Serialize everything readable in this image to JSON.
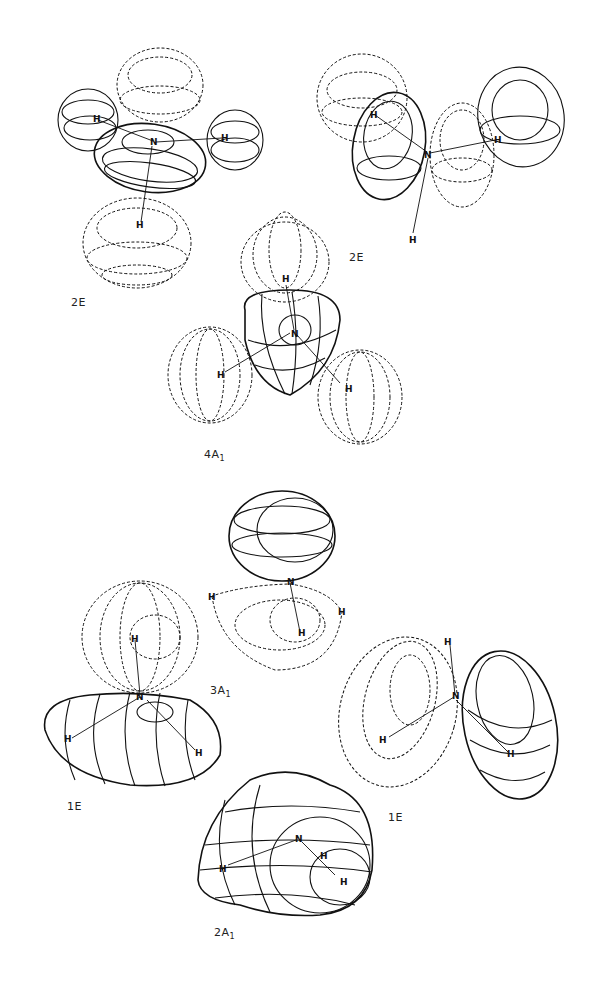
{
  "figure": {
    "panels": [
      {
        "id": "2e-left",
        "label": "2E",
        "sub": ""
      },
      {
        "id": "2e-right",
        "label": "2E",
        "sub": ""
      },
      {
        "id": "4a1",
        "label": "4A",
        "sub": "1"
      },
      {
        "id": "3a1",
        "label": "3A",
        "sub": "1"
      },
      {
        "id": "1e-left",
        "label": "1E",
        "sub": ""
      },
      {
        "id": "1e-right",
        "label": "1E",
        "sub": ""
      },
      {
        "id": "2a1",
        "label": "2A",
        "sub": "1"
      }
    ],
    "atoms": {
      "nitrogen": "N",
      "hydrogen": "H"
    }
  }
}
